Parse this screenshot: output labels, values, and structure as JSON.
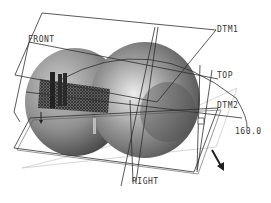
{
  "viewport": {
    "background": "#ffffff",
    "model_color": "#8a8a8a",
    "datum_line_color": "#2e2e2e",
    "light_line_color": "#bdbdbd"
  },
  "datum_planes": [
    {
      "id": "front",
      "label": "FRONT"
    },
    {
      "id": "dtm1",
      "label": "DTM1"
    },
    {
      "id": "top",
      "label": "TOP"
    },
    {
      "id": "dtm2",
      "label": "DTM2"
    },
    {
      "id": "right",
      "label": "RIGHT"
    }
  ],
  "dimension": {
    "value": "160.0"
  },
  "direction_arrow": {
    "icon": "arrow-down-right-icon"
  }
}
